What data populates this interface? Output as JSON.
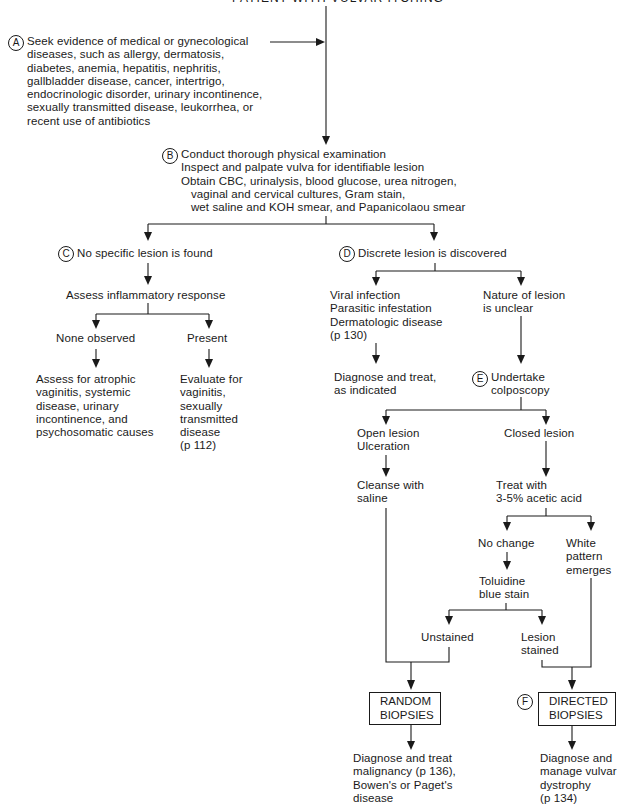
{
  "title": "PATIENT WITH VULVAR ITCHING",
  "steps": {
    "A": {
      "marker": "A",
      "text": "Seek evidence of medical or gynecological\ndiseases, such as allergy, dermatosis,\ndiabetes, anemia, hepatitis, nephritis,\ngallbladder disease, cancer, intertrigo,\nendocrinologic disorder, urinary incontinence,\nsexually transmitted disease, leukorrhea, or\nrecent use of antibiotics"
    },
    "B": {
      "marker": "B",
      "text": "Conduct thorough physical examination\nInspect and palpate vulva for identifiable lesion\nObtain CBC, urinalysis, blood glucose, urea nitrogen,\n   vaginal and cervical cultures, Gram stain,\n   wet saline and KOH smear, and Papanicolaou smear"
    },
    "C": {
      "marker": "C",
      "text": "No specific lesion is found"
    },
    "D": {
      "marker": "D",
      "text": "Discrete lesion is discovered"
    },
    "E": {
      "marker": "E",
      "text": "Undertake\ncolposcopy"
    },
    "F": {
      "marker": "F"
    }
  },
  "nodes": {
    "assess_inflammatory": "Assess inflammatory response",
    "none_observed": "None observed",
    "present": "Present",
    "assess_atrophic": "Assess for atrophic\nvaginitis, systemic\ndisease, urinary\nincontinence, and\npsychosomatic causes",
    "evaluate_vaginitis": "Evaluate for\nvaginitis,\nsexually\ntransmitted\ndisease\n(p 112)",
    "viral_infection": "Viral infection\nParasitic infestation\nDermatologic disease\n(p 130)",
    "nature_unclear": "Nature of lesion\nis unclear",
    "diagnose_treat_indicated": "Diagnose and treat,\nas indicated",
    "open_lesion": "Open lesion\nUlceration",
    "closed_lesion": "Closed lesion",
    "cleanse_saline": "Cleanse with\nsaline",
    "treat_acetic": "Treat with\n3-5% acetic acid",
    "no_change": "No change",
    "white_pattern": "White\npattern\nemerges",
    "toluidine": "Toluidine\nblue stain",
    "unstained": "Unstained",
    "lesion_stained": "Lesion\nstained",
    "random_biopsies": "RANDOM\nBIOPSIES",
    "directed_biopsies": "DIRECTED\nBIOPSIES",
    "diagnose_malignancy": "Diagnose and treat\nmalignancy (p 136),\nBowen's or Paget's\ndisease",
    "diagnose_dystrophy": "Diagnose and\nmanage vulvar\ndystrophy\n(p 134)"
  }
}
